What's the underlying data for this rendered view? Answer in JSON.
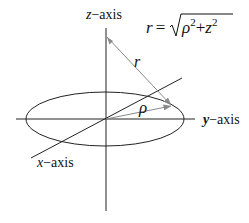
{
  "diagram": {
    "colors": {
      "axis": "#222222",
      "arrow": "#8a8a8a",
      "text": "#111111",
      "background": "#ffffff"
    },
    "axes": {
      "z": {
        "var": "z",
        "suffix": "−axis"
      },
      "y": {
        "var": "y",
        "suffix": "−axis"
      },
      "x": {
        "var": "x",
        "suffix": "−axis"
      }
    },
    "vectors": {
      "r": {
        "label": "r"
      },
      "rho": {
        "label": "ρ"
      }
    },
    "formula": {
      "lhs": "r",
      "eq": "=",
      "rho": "ρ",
      "exp1": "2",
      "plus": "+",
      "z": "z",
      "exp2": "2"
    }
  }
}
